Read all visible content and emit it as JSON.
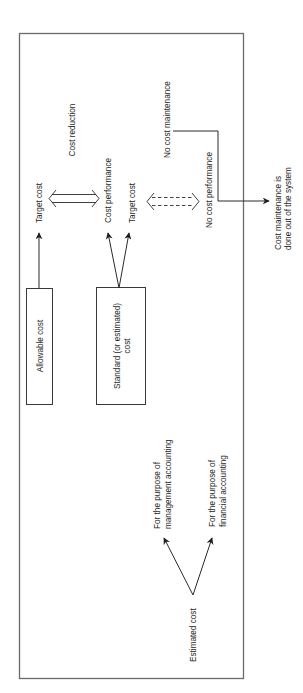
{
  "diagram": {
    "orientation": "rotated 90 degrees counter-clockwise",
    "nodes": {
      "allowable_cost": "Allowable cost",
      "standard_cost_line1": "Standard (or estimated)",
      "standard_cost_line2": "cost",
      "target_cost_top": "Target cost",
      "cost_performance": "Cost performance",
      "target_cost_bottom": "Target cost",
      "cost_reduction": "Cost reduction",
      "no_cost_performance": "No cost performance",
      "no_cost_maintenance": "No cost maintenance",
      "outside_line1": "Cost maintenance is",
      "outside_line2": "done out of the system",
      "estimated_cost": "Estimated cost",
      "mgmt_line1": "For the purpose of",
      "mgmt_line2": "management accounting",
      "fin_line1": "For the purpose of",
      "fin_line2": "financial accounting"
    },
    "edges": [
      {
        "from": "Allowable cost",
        "to": "Target cost",
        "style": "solid-arrow"
      },
      {
        "from": "Standard (or estimated) cost",
        "to": "Cost performance",
        "style": "solid-arrow"
      },
      {
        "from": "Standard (or estimated) cost",
        "to": "Target cost",
        "style": "solid-arrow"
      },
      {
        "from": "Target cost",
        "to": "Cost performance",
        "style": "double-outline-bidirectional",
        "label": "Cost reduction"
      },
      {
        "from": "Target cost",
        "to": "No cost performance",
        "style": "dashed-double-bidirectional"
      },
      {
        "from": "No cost maintenance",
        "to": "Cost maintenance is done out of the system",
        "style": "elbow-arrow"
      },
      {
        "from": "Estimated cost",
        "to": "For the purpose of management accounting",
        "style": "solid-arrow"
      },
      {
        "from": "Estimated cost",
        "to": "For the purpose of financial accounting",
        "style": "solid-arrow"
      }
    ],
    "colors": {
      "line": "#2a2a2a",
      "frame": "#6a6a6a",
      "text": "#1e1e1e",
      "background": "#ffffff"
    }
  }
}
